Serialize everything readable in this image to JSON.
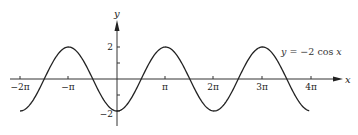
{
  "chart_data": {
    "type": "line",
    "title": "",
    "function": "y = -2 cos x",
    "xlabel": "x",
    "ylabel": "y",
    "x_ticks": [
      {
        "value": -6.2832,
        "label": "−2π"
      },
      {
        "value": -3.1416,
        "label": "−π"
      },
      {
        "value": 3.1416,
        "label": "π"
      },
      {
        "value": 6.2832,
        "label": "2π"
      },
      {
        "value": 9.4248,
        "label": "3π"
      },
      {
        "value": 12.5664,
        "label": "4π"
      }
    ],
    "y_ticks": [
      {
        "value": 2,
        "label": "2"
      },
      {
        "value": 1,
        "label": ""
      },
      {
        "value": -1,
        "label": ""
      },
      {
        "value": -2,
        "label": "−2"
      }
    ],
    "xlim": [
      -6.8,
      13.5
    ],
    "ylim": [
      -2.6,
      3.8
    ],
    "grid": false,
    "legend": null,
    "annotation": {
      "text": "y = −2 cos x",
      "x": 10.6,
      "y": 1.7
    },
    "series": [
      {
        "name": "y = −2 cos x",
        "x": [
          -6.2832,
          -4.7124,
          -3.1416,
          -1.5708,
          0,
          1.5708,
          3.1416,
          4.7124,
          6.2832,
          7.854,
          9.4248,
          10.9956,
          12.5664
        ],
        "values": [
          -2,
          0,
          2,
          0,
          -2,
          0,
          2,
          0,
          -2,
          0,
          2,
          0,
          -2
        ]
      }
    ]
  },
  "labels": {
    "x_axis": "x",
    "y_axis": "y",
    "equation_y": "y",
    "equation_rest": " = −2 cos ",
    "equation_x": "x",
    "xt0": "−2π",
    "xt1": "−π",
    "xt2": "π",
    "xt3": "2π",
    "xt4": "3π",
    "xt5": "4π",
    "yt_pos": "2",
    "yt_neg": "−2"
  }
}
